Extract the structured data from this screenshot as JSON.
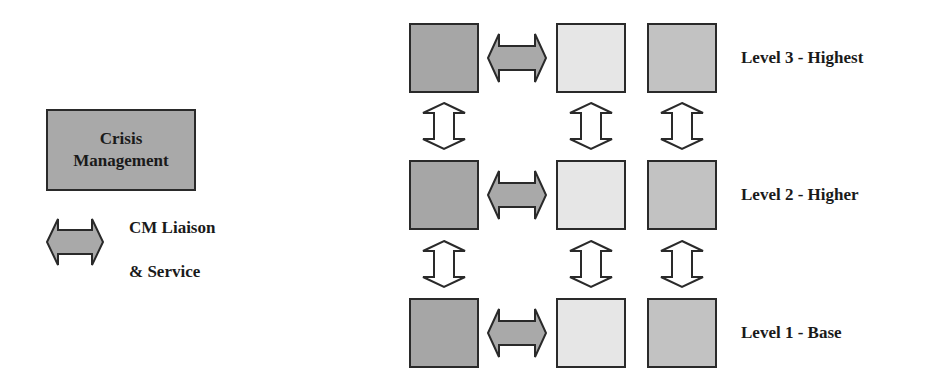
{
  "key": {
    "title": "Key:",
    "crisis_box": {
      "line1": "Crisis",
      "line2": "Management",
      "fill": "#a9a9a9"
    },
    "liaison": {
      "line1": "CM Liaison",
      "line2": "& Service",
      "fill": "#a9a9a9"
    }
  },
  "colors": {
    "column1": "#a6a6a6",
    "column2": "#e6e6e6",
    "column3": "#c2c2c2",
    "border": "#2a2a2a",
    "vertical_arrow_fill": "#ffffff",
    "liaison_arrow_fill": "#a9a9a9"
  },
  "levels": [
    {
      "label": "Level 3 - Highest"
    },
    {
      "label": "Level 2 - Higher"
    },
    {
      "label": "Level 1 - Base"
    }
  ]
}
